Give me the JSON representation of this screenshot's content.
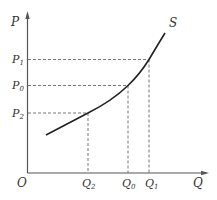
{
  "diagram": {
    "type": "supply-curve",
    "curve_label": "S",
    "axes": {
      "y_label": "P",
      "x_label": "Q",
      "origin_label": "O"
    },
    "price_levels": [
      {
        "id": "P1",
        "label": "P",
        "sub": "1",
        "y": 59.5,
        "x_end": 149
      },
      {
        "id": "P0",
        "label": "P",
        "sub": "0",
        "y": 85.5,
        "x_end": 128
      },
      {
        "id": "P2",
        "label": "P",
        "sub": "2",
        "y": 113,
        "x_end": 88
      }
    ],
    "quantity_levels": [
      {
        "id": "Q2",
        "label": "Q",
        "sub": "2",
        "x": 88
      },
      {
        "id": "Q0",
        "label": "Q",
        "sub": "0",
        "x": 128
      },
      {
        "id": "Q1",
        "label": "Q",
        "sub": "1",
        "x": 149
      }
    ],
    "colors": {
      "axis": "#555555",
      "curve": "#222222",
      "dash": "#666666",
      "text": "#333333"
    }
  }
}
